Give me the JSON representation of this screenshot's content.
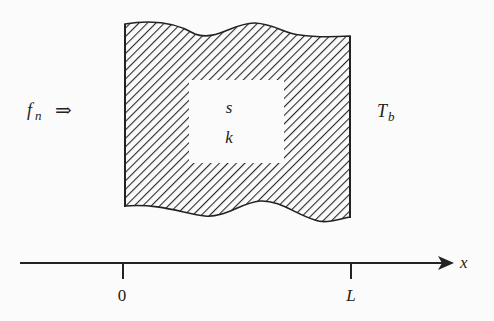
{
  "diagram": {
    "title": "",
    "slab": {
      "left_label": "f",
      "left_label_sub": "n",
      "left_arrow": "⇒",
      "right_label": "T",
      "right_label_sub": "b",
      "inner_labels": [
        "s",
        "k"
      ]
    },
    "axis": {
      "label": "x",
      "ticks": [
        "0",
        "L"
      ]
    },
    "colors": {
      "ink": "#222222",
      "background": "#fbfbfb",
      "hatch": "#2a2a2a"
    }
  }
}
